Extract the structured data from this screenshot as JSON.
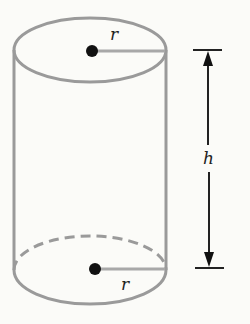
{
  "diagram": {
    "labels": {
      "top_radius": "r",
      "bottom_radius": "r",
      "height": "h"
    },
    "colors": {
      "background": "#fbfbf8",
      "outline": "#9a9a9a",
      "radius_line": "#a8a8a8",
      "center_dot": "#111111",
      "dimension": "#111111",
      "label": "#222222"
    }
  }
}
